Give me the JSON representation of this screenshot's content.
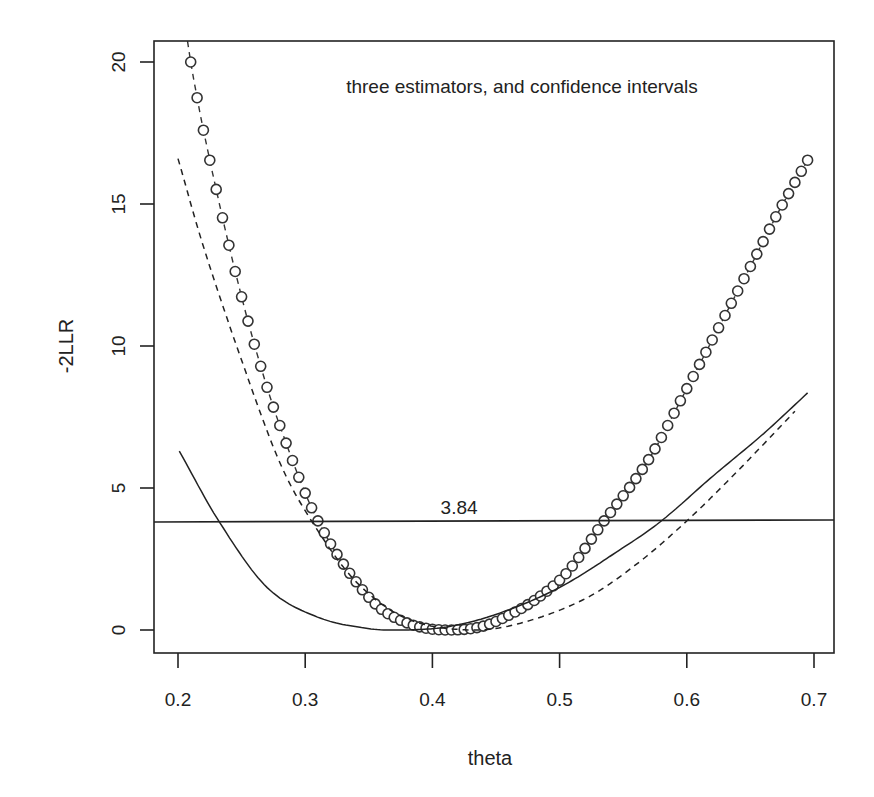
{
  "chart_data": {
    "type": "line",
    "title": "",
    "annotation": "three estimators, and confidence intervals",
    "xlabel": "theta",
    "ylabel": "-2LLR",
    "xlim": [
      0.185,
      0.71
    ],
    "ylim": [
      -0.8,
      20.8
    ],
    "x_ticks": [
      "0.2",
      "0.3",
      "0.4",
      "0.5",
      "0.6",
      "0.7"
    ],
    "x_tick_values": [
      0.2,
      0.3,
      0.4,
      0.5,
      0.6,
      0.7
    ],
    "y_ticks": [
      "0",
      "5",
      "10",
      "15",
      "20"
    ],
    "y_tick_values": [
      0,
      5,
      10,
      15,
      20
    ],
    "grid": false,
    "legend": null,
    "reference_line": {
      "y": 3.84,
      "label": "3.84",
      "label_x": 0.42
    },
    "series": [
      {
        "name": "estimator 1 (circles, dashed connector)",
        "style": "points-circle",
        "x_range": [
          0.21,
          0.697
        ],
        "step": 0.005,
        "knots": [
          [
            0.205,
            21.5
          ],
          [
            0.21,
            20.0
          ],
          [
            0.22,
            17.6
          ],
          [
            0.2408,
            13.4
          ],
          [
            0.2604,
            10.0
          ],
          [
            0.28,
            7.2
          ],
          [
            0.31,
            3.84
          ],
          [
            0.35,
            1.15
          ],
          [
            0.38,
            0.25
          ],
          [
            0.415,
            0.0
          ],
          [
            0.45,
            0.3
          ],
          [
            0.5,
            1.75
          ],
          [
            0.535,
            3.84
          ],
          [
            0.57,
            6.0
          ],
          [
            0.6,
            8.5
          ],
          [
            0.65,
            12.8
          ],
          [
            0.673,
            14.8
          ],
          [
            0.697,
            16.7
          ]
        ]
      },
      {
        "name": "estimator 2 (solid)",
        "style": "solid",
        "knots": [
          [
            0.201,
            6.3
          ],
          [
            0.232,
            3.84
          ],
          [
            0.27,
            1.5
          ],
          [
            0.31,
            0.45
          ],
          [
            0.35,
            0.05
          ],
          [
            0.375,
            0.0
          ],
          [
            0.41,
            0.1
          ],
          [
            0.45,
            0.55
          ],
          [
            0.5,
            1.5
          ],
          [
            0.55,
            2.9
          ],
          [
            0.58,
            3.84
          ],
          [
            0.62,
            5.4
          ],
          [
            0.66,
            6.9
          ],
          [
            0.695,
            8.35
          ]
        ]
      },
      {
        "name": "estimator 3 (dashed)",
        "style": "dashed",
        "knots": [
          [
            0.2,
            16.6
          ],
          [
            0.22,
            13.5
          ],
          [
            0.25,
            9.5
          ],
          [
            0.28,
            5.9
          ],
          [
            0.305,
            3.84
          ],
          [
            0.34,
            1.7
          ],
          [
            0.38,
            0.4
          ],
          [
            0.43,
            0.0
          ],
          [
            0.47,
            0.25
          ],
          [
            0.52,
            1.1
          ],
          [
            0.56,
            2.3
          ],
          [
            0.6,
            3.84
          ],
          [
            0.64,
            5.6
          ],
          [
            0.685,
            7.7
          ]
        ]
      }
    ]
  }
}
